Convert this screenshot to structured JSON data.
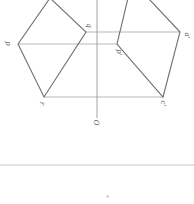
{
  "diagram": {
    "background": "#ffffff",
    "line_color": "#6e6e6e",
    "thin_line_color": "#9a9a9a",
    "labels": {
      "p": "p",
      "q": "q",
      "r": "r",
      "p_prime": "p'",
      "a": "a'",
      "c_prime": "c'",
      "origin": "O",
      "bottom_mark": "*"
    },
    "left_shape_points": "50,-2 86,32 44,97 18,44",
    "left_inner_line": "86,32 44,97",
    "right_shape_points": "128,-2 117,44 163,97 180,32 148,-2",
    "axis": {
      "x": 97,
      "y1": 0,
      "y2": 118
    },
    "projection_lines": [
      {
        "x1": 86,
        "y1": 32,
        "x2": 180,
        "y2": 32
      },
      {
        "x1": 18,
        "y1": 44,
        "x2": 117,
        "y2": 44
      },
      {
        "x1": 44,
        "y1": 97,
        "x2": 163,
        "y2": 97
      }
    ],
    "separator_y": 165
  }
}
